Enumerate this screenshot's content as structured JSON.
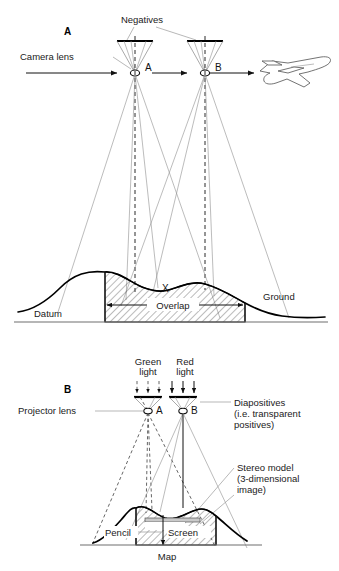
{
  "figure": {
    "title_implicit": "Stereoscopic aerial photography and plotting diagram",
    "panels": [
      {
        "key": "A",
        "label": "A"
      },
      {
        "key": "B",
        "label": "B"
      }
    ]
  },
  "panel_a": {
    "label": "A",
    "labels": {
      "negatives": "Negatives",
      "camera_lens": "Camera lens",
      "station_a": "A",
      "station_b": "B",
      "point_x": "X",
      "datum": "Datum",
      "overlap": "Overlap",
      "ground": "Ground"
    },
    "icons": {
      "aircraft": "airplane-icon",
      "flight_direction": "arrow-right-icon"
    }
  },
  "panel_b": {
    "label": "B",
    "labels": {
      "green_light": "Green\nlight",
      "green_light_line1": "Green",
      "green_light_line2": "light",
      "red_light_line1": "Red",
      "red_light_line2": "light",
      "projector_lens": "Projector lens",
      "station_a": "A",
      "station_b": "B",
      "diapositives_line1": "Diapositives",
      "diapositives_line2": "(i.e. transparent",
      "diapositives_line3": "positives)",
      "stereo_model_line1": "Stereo model",
      "stereo_model_line2": "(3-dimensional",
      "stereo_model_line3": "image)",
      "pencil": "Pencil",
      "screen": "Screen",
      "map": "Map"
    },
    "icons": {
      "green_ray_arrows": "arrow-down-dashed-icon",
      "red_ray_arrows": "arrow-down-icon",
      "pencil_arrow": "arrow-down-icon"
    }
  },
  "colors": {
    "ink": "#1a1a1a",
    "ray_thin": "#8e8e8e",
    "terrain": "#000000",
    "hatch": "#555555",
    "screen_fill": "#c9c9c9",
    "baseline": "#6f6f6f",
    "background": "#ffffff"
  }
}
